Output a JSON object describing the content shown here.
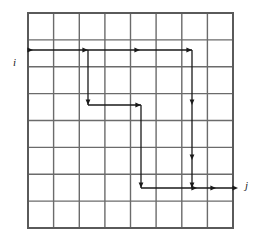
{
  "figure": {
    "type": "grid-traversal-diagram",
    "grid": {
      "columns": 8,
      "rows": 8,
      "left": 28,
      "top": 13,
      "right": 233,
      "bottom": 228,
      "cell_width": 25.6,
      "cell_height": 26.9,
      "line_color": "#6b6b6b",
      "border_color": "#5a5a5a",
      "line_width": 1.4,
      "border_width": 2.0
    },
    "axes": [
      {
        "name": "i",
        "label": "i",
        "x": 13,
        "y": 57,
        "orientation": "vertical-downward-index"
      },
      {
        "name": "j",
        "label": "j",
        "x": 245,
        "y": 180,
        "orientation": "horizontal-rightward-index"
      }
    ],
    "path": {
      "color": "#1a1a1a",
      "line_width": 1.3,
      "arrow_size": 4.2,
      "segments": [
        {
          "name": "row1-right",
          "x1": 28,
          "y1": 50,
          "x2": 192,
          "y2": 50,
          "dir": "right"
        },
        {
          "name": "col3-down",
          "x1": 88,
          "y1": 50,
          "x2": 88,
          "y2": 105,
          "dir": "down"
        },
        {
          "name": "row4-right",
          "x1": 88,
          "y1": 105,
          "x2": 141,
          "y2": 105,
          "dir": "right"
        },
        {
          "name": "col5-down",
          "x1": 141,
          "y1": 105,
          "x2": 141,
          "y2": 188,
          "dir": "down"
        },
        {
          "name": "row7-right",
          "x1": 141,
          "y1": 188,
          "x2": 233,
          "y2": 188,
          "dir": "right"
        },
        {
          "name": "col7-down",
          "x1": 192,
          "y1": 50,
          "x2": 192,
          "y2": 188,
          "dir": "down"
        }
      ],
      "arrowheads": [
        {
          "name": "arrow-row1-a",
          "x": 33,
          "y": 50,
          "dir": "right"
        },
        {
          "name": "arrow-row1-b",
          "x": 88,
          "y": 50,
          "dir": "right"
        },
        {
          "name": "arrow-row1-c",
          "x": 140,
          "y": 50,
          "dir": "right"
        },
        {
          "name": "arrow-row1-d",
          "x": 192,
          "y": 50,
          "dir": "right"
        },
        {
          "name": "arrow-col3-end",
          "x": 88,
          "y": 105,
          "dir": "down"
        },
        {
          "name": "arrow-row4-end",
          "x": 141,
          "y": 105,
          "dir": "right"
        },
        {
          "name": "arrow-col5-end",
          "x": 141,
          "y": 188,
          "dir": "down"
        },
        {
          "name": "arrow-col7-mid1",
          "x": 192,
          "y": 105,
          "dir": "down"
        },
        {
          "name": "arrow-col7-mid2",
          "x": 192,
          "y": 160,
          "dir": "down"
        },
        {
          "name": "arrow-col7-end",
          "x": 192,
          "y": 188,
          "dir": "down"
        },
        {
          "name": "arrow-row7-a",
          "x": 197,
          "y": 188,
          "dir": "right"
        },
        {
          "name": "arrow-row7-b",
          "x": 216,
          "y": 188,
          "dir": "right"
        },
        {
          "name": "arrow-row7-c",
          "x": 238,
          "y": 188,
          "dir": "right"
        }
      ]
    }
  }
}
